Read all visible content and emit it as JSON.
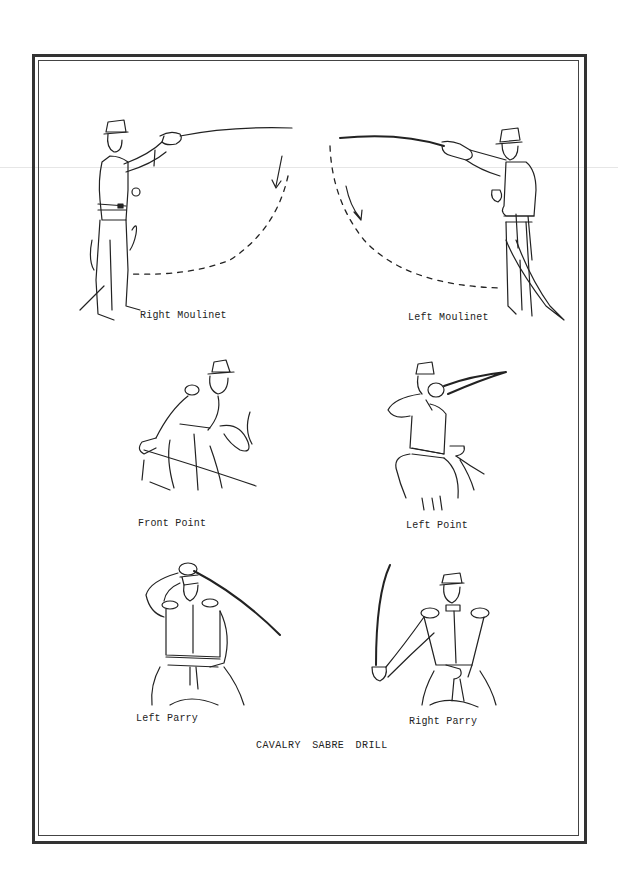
{
  "document": {
    "title": "CAVALRY SABRE DRILL",
    "figures": [
      {
        "id": "right-moulinet",
        "caption": "Right Moulinet"
      },
      {
        "id": "left-moulinet",
        "caption": "Left Moulinet"
      },
      {
        "id": "front-point",
        "caption": "Front Point"
      },
      {
        "id": "left-point",
        "caption": "Left Point"
      },
      {
        "id": "left-parry",
        "caption": "Left Parry"
      },
      {
        "id": "right-parry",
        "caption": "Right Parry"
      }
    ]
  },
  "colors": {
    "ink": "#222222",
    "paper": "#ffffff",
    "frame": "#333333"
  }
}
